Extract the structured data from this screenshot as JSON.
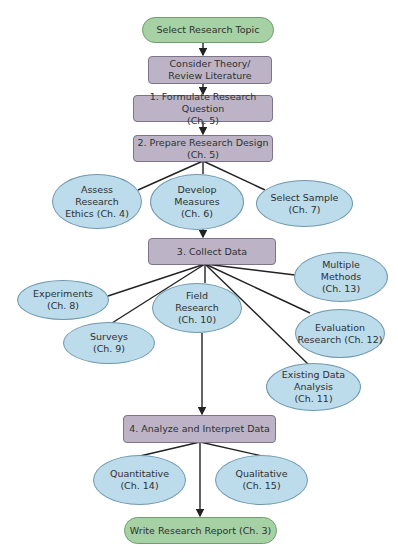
{
  "diagram": {
    "colors": {
      "start_end": "#a6d1a4",
      "step": "#bcb4c6",
      "topic": "#bcdceb",
      "line": "#222222"
    },
    "nodes": {
      "select_topic": "Select Research Topic",
      "consider_theory": "Consider Theory/\nReview Literature",
      "formulate": "1. Formulate Research Question\n(Ch. 5)",
      "prepare": "2. Prepare Research Design\n(Ch. 5)",
      "ethics": "Assess\nResearch\nEthics (Ch. 4)",
      "measures": "Develop\nMeasures\n(Ch. 6)",
      "sample": "Select Sample\n(Ch. 7)",
      "collect": "3. Collect Data",
      "experiments": "Experiments\n(Ch. 8)",
      "surveys": "Surveys\n(Ch. 9)",
      "field": "Field\nResearch\n(Ch. 10)",
      "multiple": "Multiple\nMethods\n(Ch. 13)",
      "evaluation": "Evaluation\nResearch (Ch. 12)",
      "existing": "Existing Data\nAnalysis\n(Ch. 11)",
      "analyze": "4. Analyze and Interpret Data",
      "quantitative": "Quantitative\n(Ch. 14)",
      "qualitative": "Qualitative\n(Ch. 15)",
      "report": "Write Research Report (Ch. 3)"
    }
  }
}
